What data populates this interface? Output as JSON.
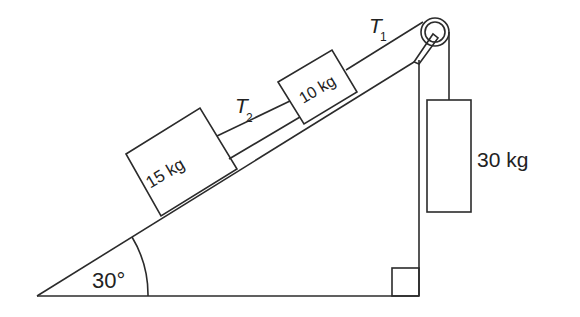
{
  "diagram": {
    "type": "inclined plane with pulley",
    "angle_label": "30°",
    "blocks": [
      {
        "id": "block-15kg",
        "label": "15 kg"
      },
      {
        "id": "block-10kg",
        "label": "10 kg"
      },
      {
        "id": "block-30kg",
        "label": "30 kg"
      }
    ],
    "tensions": {
      "t1": {
        "symbol": "T",
        "subscript": "1"
      },
      "t2": {
        "symbol": "T",
        "subscript": "2"
      }
    },
    "colors": {
      "stroke": "#2b2b2b",
      "background": "#ffffff"
    }
  }
}
